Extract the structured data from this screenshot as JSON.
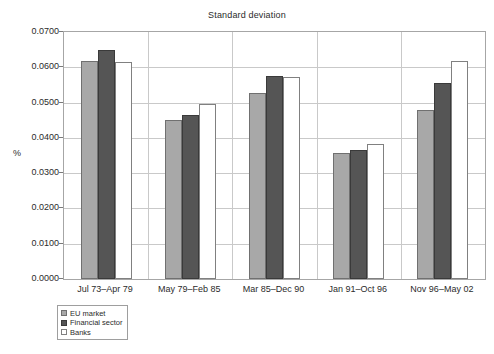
{
  "chart_data": {
    "type": "bar",
    "title": "Standard deviation",
    "xlabel": "",
    "ylabel": "%",
    "ylim": [
      0.0,
      0.07
    ],
    "ytick_step": 0.01,
    "ytick_labels": [
      "0.0000",
      "0.0100",
      "0.0200",
      "0.0300",
      "0.0400",
      "0.0500",
      "0.0600",
      "0.0700"
    ],
    "ytick_values": [
      0.0,
      0.01,
      0.02,
      0.03,
      0.04,
      0.05,
      0.06,
      0.07
    ],
    "grid": true,
    "legend_position": "below-left",
    "categories": [
      "Jul 73–Apr 79",
      "May 79–Feb 85",
      "Mar 85–Dec 90",
      "Jan 91–Oct 96",
      "Nov 96–May 02"
    ],
    "series": [
      {
        "name": "EU market",
        "color": "#a8a8a8",
        "values": [
          0.0617,
          0.045,
          0.0528,
          0.0358,
          0.048
        ]
      },
      {
        "name": "Financial sector",
        "color": "#555555",
        "values": [
          0.065,
          0.0465,
          0.0575,
          0.0365,
          0.0555
        ]
      },
      {
        "name": "Banks",
        "color": "#ffffff",
        "values": [
          0.0615,
          0.0495,
          0.0573,
          0.0382,
          0.0617
        ]
      }
    ]
  }
}
